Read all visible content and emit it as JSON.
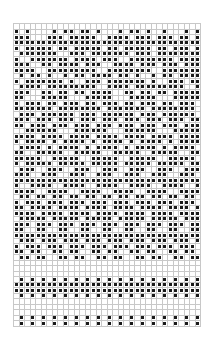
{
  "chart_label": "2 0 3",
  "grid": {
    "columns": 34,
    "stitch_color": "#1a1a1a",
    "line_color": "#c8c8c8",
    "rows": [
      "0000000000000000000000000000000000",
      "1010000101101101000101101001000101",
      "1110001110111110011110111011101101",
      "1111111111111111111111111111111111",
      "1011111011011111011011111011011101",
      "0111111100111011111110111011111111",
      "1001111111011110111001111111101111",
      "1110011011110111001111011101110111",
      "1111001111111110011111111001111111",
      "0101101001011011110110100101101111",
      "1011111110100111011111110100111011",
      "0111101111111110011110111111111001",
      "1110011011011011110011011011011111",
      "1100011111000111110001111100011111",
      "1011101101110110111011011101101110",
      "1111111011111111011111110111111110",
      "0111011111101110111111011101111110",
      "1110111011101110111011101110111011",
      "1101110111011101110111011101110111",
      "0011111100011111100011111100011111",
      "1111011110111101111011110111101111",
      "1011110101111010111101011110101111",
      "0111101011110101111010111101011110",
      "1100111110011111001111100111110011",
      "1111100111110011111001111100111110",
      "1011111011111011111011111011111011",
      "0111001110011100111001110011100111",
      "1110011100111001110011100111001110",
      "1111111111111111111111111111111111",
      "1001111001111001111001111001111001",
      "1111001111001111001111001111001111",
      "0110110110110110110110110110110110",
      "1011101110111011101110111011101110",
      "1101111011110111101111011110111101",
      "1111011110111101111011110111101111",
      "0111110111110111110111110111110111",
      "1110111011101110111011101110111011",
      "1100110011001100110011001100110011",
      "1111111111111111111111111111111111",
      "0111011101110111011101110111011101",
      "1011101110111011101110111011101110",
      "1101100110110011011001101100110110",
      "0110110011011001101100110110011011",
      "0000000000000000000000000000000000",
      "0000000000000000000000000000000000",
      "0000000000000000000000000000000000",
      "0101010101010101010101010101010101",
      "1111111111111111111111111111111111",
      "1111111111111111111111111111111111",
      "0101010101010101010101010101010101",
      "0000000000000000000000000000000000",
      "0000000000000000000000000000000000",
      "0000000000000000000000000000000000",
      "0101010101010101010101010101010101",
      "0101010101010101010101010101010101"
    ]
  }
}
